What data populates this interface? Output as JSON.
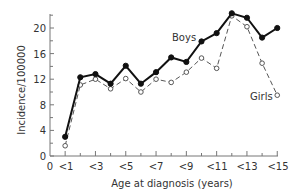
{
  "chart_data": {
    "type": "line",
    "title": "",
    "xlabel": "Age at diagnosis (years)",
    "ylabel": "Incidence/100000",
    "x": [
      1,
      2,
      3,
      4,
      5,
      6,
      7,
      8,
      9,
      10,
      11,
      12,
      13,
      14,
      15
    ],
    "x_tick_labels": [
      "0",
      "<1",
      "<3",
      "<5",
      "<7",
      "<9",
      "<11",
      "<13",
      "<15"
    ],
    "y_ticks": [
      0,
      4,
      8,
      12,
      16,
      20
    ],
    "ylim": [
      0,
      22
    ],
    "xlim": [
      0,
      15
    ],
    "grid": false,
    "legend": "inline labels",
    "series": [
      {
        "name": "Boys",
        "style": "solid line, filled circle markers",
        "color": "#111111",
        "values": [
          3.0,
          12.3,
          12.8,
          11.3,
          14.1,
          11.3,
          13.1,
          15.4,
          14.7,
          17.9,
          19.2,
          22.3,
          21.6,
          18.5,
          20.0
        ]
      },
      {
        "name": "Girls",
        "style": "dashed line, open circle markers",
        "color": "#555555",
        "values": [
          1.6,
          11.1,
          12.0,
          10.5,
          12.1,
          10.0,
          12.0,
          11.5,
          13.1,
          15.3,
          13.7,
          21.9,
          20.2,
          14.5,
          9.5
        ]
      }
    ]
  },
  "labels": {
    "boys": "Boys",
    "girls": "Girls",
    "xlabel": "Age at diagnosis (years)",
    "ylabel": "Incidence/100000",
    "y0": "0",
    "y4": "4",
    "y8": "8",
    "y12": "12",
    "y16": "16",
    "y20": "20",
    "x0": "0",
    "x1": "<1",
    "x3": "<3",
    "x5": "<5",
    "x7": "<7",
    "x9": "<9",
    "x11": "<11",
    "x13": "<13",
    "x15": "<15"
  }
}
